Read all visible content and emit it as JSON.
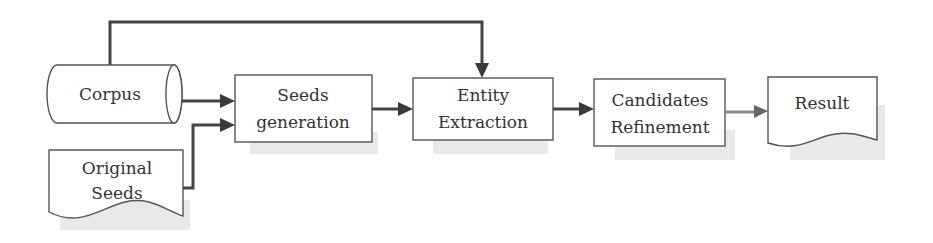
{
  "diagram": {
    "type": "flowchart",
    "nodes": [
      {
        "id": "corpus",
        "shape": "cylinder",
        "lines": [
          "Corpus"
        ]
      },
      {
        "id": "original_seeds",
        "shape": "document",
        "lines": [
          "Original",
          "Seeds"
        ]
      },
      {
        "id": "seeds_generation",
        "shape": "process",
        "lines": [
          "Seeds",
          "generation"
        ]
      },
      {
        "id": "entity_extraction",
        "shape": "process",
        "lines": [
          "Entity",
          "Extraction"
        ]
      },
      {
        "id": "candidates_refinement",
        "shape": "process",
        "lines": [
          "Candidates",
          "Refinement"
        ]
      },
      {
        "id": "result",
        "shape": "document",
        "lines": [
          "Result"
        ]
      }
    ],
    "edges": [
      {
        "from": "corpus",
        "to": "seeds_generation"
      },
      {
        "from": "original_seeds",
        "to": "seeds_generation"
      },
      {
        "from": "corpus",
        "to": "entity_extraction",
        "route": "over-top"
      },
      {
        "from": "seeds_generation",
        "to": "entity_extraction"
      },
      {
        "from": "entity_extraction",
        "to": "candidates_refinement"
      },
      {
        "from": "candidates_refinement",
        "to": "result"
      }
    ],
    "colors": {
      "stroke": "#555555",
      "arrow": "#3a3a3a",
      "text": "#333333",
      "shadow": "#e9e9e9",
      "background": "#ffffff"
    }
  }
}
